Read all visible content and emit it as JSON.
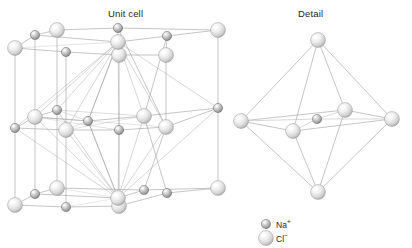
{
  "figure": {
    "name": "sodium-chloride-crystal-structure",
    "background_color": "#ffffff",
    "bond_color": "#9a9a9a",
    "panels": [
      {
        "id": "unit-cell",
        "title": "Unit cell"
      },
      {
        "id": "detail",
        "title": "Detail"
      }
    ]
  },
  "titles": {
    "unit_cell": "Unit cell",
    "detail": "Detail"
  },
  "legend": {
    "items": [
      {
        "id": "na",
        "icon": "sphere-icon",
        "label": "Na+",
        "symbol": "Na",
        "charge": "+",
        "radius_px": 4.6,
        "fill_light": "#f2f2f2",
        "fill_mid": "#b4b4b4",
        "fill_dark": "#6e6e6e",
        "stroke": "#6b6b6b"
      },
      {
        "id": "cl",
        "icon": "sphere-icon",
        "label": "Cl-",
        "symbol": "Cl",
        "charge": "−",
        "radius_px": 7.4,
        "fill_light": "#ffffff",
        "fill_mid": "#e3e3e3",
        "fill_dark": "#a8a8a8",
        "stroke": "#9b9b9b"
      }
    ],
    "icon_positions": [
      {
        "cx": 266,
        "cy": 224,
        "ion": "na"
      },
      {
        "cx": 266,
        "cy": 238,
        "ion": "cl"
      }
    ]
  },
  "chart_data": {
    "type": "scatter",
    "xlabel": "",
    "ylabel": "",
    "unit_cell": {
      "title": "Unit cell",
      "lattice_type": "face-centred cubic (rock salt)",
      "layers": [
        "top",
        "middle",
        "bottom"
      ],
      "atoms": [
        {
          "id": "t-fl",
          "ion": "cl",
          "x": 15,
          "y": 48,
          "layer": "top",
          "site": "front-left-corner"
        },
        {
          "id": "t-fc",
          "ion": "na",
          "x": 66,
          "y": 52,
          "layer": "top",
          "site": "front-edge-centre"
        },
        {
          "id": "t-fr",
          "ion": "cl",
          "x": 119,
          "y": 55,
          "layer": "top",
          "site": "front-right-corner"
        },
        {
          "id": "t-ml",
          "ion": "na",
          "x": 35,
          "y": 35,
          "layer": "top",
          "site": "left-edge-centre"
        },
        {
          "id": "t-mc",
          "ion": "cl",
          "x": 118,
          "y": 42,
          "layer": "top",
          "site": "face-centre"
        },
        {
          "id": "t-mr",
          "ion": "na",
          "x": 167,
          "y": 36,
          "layer": "top",
          "site": "right-edge-centre"
        },
        {
          "id": "t-bl",
          "ion": "cl",
          "x": 57,
          "y": 30,
          "layer": "top",
          "site": "back-left-corner"
        },
        {
          "id": "t-bc",
          "ion": "na",
          "x": 118,
          "y": 28,
          "layer": "top",
          "site": "back-edge-centre"
        },
        {
          "id": "t-br",
          "ion": "cl",
          "x": 218,
          "y": 30,
          "layer": "top",
          "site": "back-right-corner"
        },
        {
          "id": "t-rc",
          "ion": "cl",
          "x": 166,
          "y": 55,
          "layer": "top",
          "site": "right-face-corner"
        },
        {
          "id": "m-fl",
          "ion": "na",
          "x": 15,
          "y": 128,
          "layer": "middle",
          "site": "front-left-edge"
        },
        {
          "id": "m-fc",
          "ion": "cl",
          "x": 66,
          "y": 130,
          "layer": "middle",
          "site": "front-face-centre"
        },
        {
          "id": "m-fr",
          "ion": "na",
          "x": 119,
          "y": 130,
          "layer": "middle",
          "site": "front-right-edge"
        },
        {
          "id": "m-ml",
          "ion": "cl",
          "x": 35,
          "y": 117,
          "layer": "middle",
          "site": "left-face-centre"
        },
        {
          "id": "m-mc",
          "ion": "na",
          "x": 88,
          "y": 121,
          "layer": "middle",
          "site": "body-centre"
        },
        {
          "id": "m-mr",
          "ion": "cl",
          "x": 144,
          "y": 116,
          "layer": "middle",
          "site": "right-face-centre"
        },
        {
          "id": "m-bl",
          "ion": "na",
          "x": 57,
          "y": 110,
          "layer": "middle",
          "site": "back-left-edge"
        },
        {
          "id": "m-bc",
          "ion": "cl",
          "x": 166,
          "y": 127,
          "layer": "middle",
          "site": "back-face-centre"
        },
        {
          "id": "m-br",
          "ion": "na",
          "x": 218,
          "y": 108,
          "layer": "middle",
          "site": "back-right-edge"
        },
        {
          "id": "b-fl",
          "ion": "cl",
          "x": 15,
          "y": 205,
          "layer": "bottom",
          "site": "front-left-corner"
        },
        {
          "id": "b-fc",
          "ion": "na",
          "x": 66,
          "y": 207,
          "layer": "bottom",
          "site": "front-edge-centre"
        },
        {
          "id": "b-fr",
          "ion": "cl",
          "x": 119,
          "y": 206,
          "layer": "bottom",
          "site": "front-right-corner"
        },
        {
          "id": "b-ml",
          "ion": "na",
          "x": 35,
          "y": 194,
          "layer": "bottom",
          "site": "left-edge-centre"
        },
        {
          "id": "b-mc",
          "ion": "cl",
          "x": 118,
          "y": 198,
          "layer": "bottom",
          "site": "face-centre"
        },
        {
          "id": "b-mr",
          "ion": "na",
          "x": 167,
          "y": 193,
          "layer": "bottom",
          "site": "right-edge-centre"
        },
        {
          "id": "b-bl",
          "ion": "cl",
          "x": 57,
          "y": 188,
          "layer": "bottom",
          "site": "back-left-corner"
        },
        {
          "id": "b-bc",
          "ion": "na",
          "x": 144,
          "y": 190,
          "layer": "bottom",
          "site": "back-edge-centre"
        },
        {
          "id": "b-br",
          "ion": "cl",
          "x": 218,
          "y": 188,
          "layer": "bottom",
          "site": "back-right-corner"
        }
      ],
      "counts": {
        "cl": 15,
        "na": 14,
        "total": 29
      }
    },
    "detail": {
      "title": "Detail",
      "geometry": "octahedron",
      "coordination_number": 6,
      "atoms": [
        {
          "id": "d-top",
          "ion": "cl",
          "x": 318,
          "y": 40,
          "site": "apex-top"
        },
        {
          "id": "d-left",
          "ion": "cl",
          "x": 241,
          "y": 121,
          "site": "vertex-left"
        },
        {
          "id": "d-right",
          "ion": "cl",
          "x": 392,
          "y": 119,
          "site": "vertex-right"
        },
        {
          "id": "d-front",
          "ion": "cl",
          "x": 293,
          "y": 131,
          "site": "vertex-front"
        },
        {
          "id": "d-back",
          "ion": "cl",
          "x": 345,
          "y": 110,
          "site": "vertex-back"
        },
        {
          "id": "d-centre",
          "ion": "na",
          "x": 317,
          "y": 119,
          "site": "octahedron-centre"
        },
        {
          "id": "d-bottom",
          "ion": "cl",
          "x": 318,
          "y": 192,
          "site": "apex-bottom"
        }
      ],
      "counts": {
        "cl": 6,
        "na": 1,
        "total": 7
      }
    }
  }
}
